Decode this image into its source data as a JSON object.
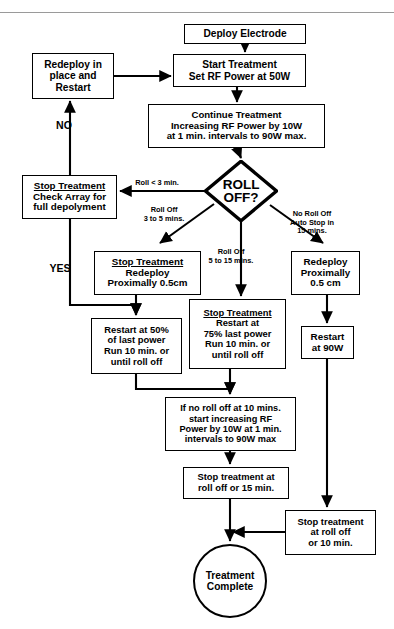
{
  "diagram": {
    "colors": {
      "stroke": "#000000",
      "fill": "#ffffff",
      "rule": "#9a9a9a"
    },
    "top_rule": true
  },
  "nodes": {
    "deploy_electrode": {
      "shape": "process",
      "lines": [
        "Deploy Electrode"
      ],
      "x": 184,
      "y": 24,
      "w": 122,
      "h": 20,
      "font": 10.2
    },
    "redeploy_in_place": {
      "shape": "process",
      "lines": [
        "Redeploy in",
        "place and",
        "Restart"
      ],
      "x": 32,
      "y": 53,
      "w": 82,
      "h": 46,
      "font": 10.2
    },
    "start_treatment": {
      "shape": "process",
      "lines": [
        "Start Treatment",
        "Set RF Power at 50W"
      ],
      "x": 173,
      "y": 54,
      "w": 133,
      "h": 33,
      "font": 10.2
    },
    "continue_treatment": {
      "shape": "process",
      "lines": [
        "Continue Treatment",
        "Increasing RF Power by 10W",
        "at 1 min. intervals to 90W max."
      ],
      "x": 148,
      "y": 104,
      "w": 177,
      "h": 44,
      "font": 9.6
    },
    "roll_off_decision": {
      "shape": "decision",
      "lines": [
        "ROLL",
        "OFF?"
      ],
      "x": 204,
      "y": 160,
      "w": 74,
      "h": 62,
      "font": 13.5
    },
    "stop_check_array": {
      "shape": "process",
      "lines": [
        "Stop Treatment",
        "Check Array for",
        "full depolyment"
      ],
      "header": 1,
      "x": 22,
      "y": 175,
      "w": 95,
      "h": 44,
      "font": 9.8
    },
    "stop_redeploy_prox": {
      "shape": "process",
      "lines": [
        "Stop Treatment",
        "Redeploy",
        "Proximally 0.5cm"
      ],
      "header": 1,
      "x": 94,
      "y": 251,
      "w": 107,
      "h": 44,
      "font": 9.8
    },
    "redeploy_proximally": {
      "shape": "process",
      "lines": [
        "Redeploy",
        "Proximally",
        "0.5 cm"
      ],
      "x": 291,
      "y": 251,
      "w": 69,
      "h": 44,
      "font": 9.8
    },
    "restart_50": {
      "shape": "process",
      "lines": [
        "Restart at 50%",
        "of last power",
        "Run 10 min. or",
        "until roll off"
      ],
      "x": 91,
      "y": 318,
      "w": 91,
      "h": 56,
      "font": 9.4
    },
    "stop_restart_75": {
      "shape": "process",
      "lines": [
        "Stop Treatment",
        "Restart at",
        "75% last power",
        "Run 10 min. or",
        "until roll off"
      ],
      "header": 1,
      "x": 189,
      "y": 299,
      "w": 97,
      "h": 70,
      "font": 9.4
    },
    "restart_90w": {
      "shape": "process",
      "lines": [
        "Restart",
        "at 90W"
      ],
      "x": 301,
      "y": 326,
      "w": 53,
      "h": 33,
      "font": 9.8
    },
    "if_no_roll_off": {
      "shape": "process",
      "lines": [
        "If no roll off at 10 mins.",
        "start increasing RF",
        "Power by 10W at 1 min.",
        "intervals to 90W max"
      ],
      "x": 165,
      "y": 397,
      "w": 131,
      "h": 54,
      "font": 9.2
    },
    "stop_roll_off_15": {
      "shape": "process",
      "lines": [
        "Stop treatment at",
        "roll off or 15 min."
      ],
      "x": 183,
      "y": 467,
      "w": 106,
      "h": 32,
      "font": 9.4
    },
    "stop_roll_off_10": {
      "shape": "process",
      "lines": [
        "Stop treatment",
        "at roll off",
        "or 10 min."
      ],
      "x": 285,
      "y": 510,
      "w": 91,
      "h": 45,
      "font": 9.4
    },
    "treatment_complete": {
      "shape": "terminal",
      "lines": [
        "Treatment",
        "Complete"
      ],
      "x": 193,
      "y": 544,
      "w": 74,
      "h": 74,
      "font": 10.2
    }
  },
  "edge_labels": {
    "no": {
      "lines": [
        "NO"
      ],
      "x": 44,
      "y": 119,
      "w": 40,
      "font": 10.6
    },
    "yes": {
      "lines": [
        "YES"
      ],
      "x": 38,
      "y": 262,
      "w": 44,
      "font": 10.6
    },
    "roll_lt_3": {
      "lines": [
        "Roll < 3 min."
      ],
      "x": 118,
      "y": 179,
      "w": 78,
      "font": 7.4
    },
    "roll_3_to_5": {
      "lines": [
        "Roll Off",
        "3 to 5 mins."
      ],
      "x": 131,
      "y": 206,
      "w": 66,
      "font": 7.4
    },
    "roll_5_to_15": {
      "lines": [
        "Roll Off",
        "5 to 15 mins."
      ],
      "x": 195,
      "y": 248,
      "w": 72,
      "font": 7.4
    },
    "no_roll_off": {
      "lines": [
        "No Roll Off",
        "Auto Stop in",
        "15 mins."
      ],
      "x": 276,
      "y": 210,
      "w": 72,
      "font": 7.4
    }
  }
}
